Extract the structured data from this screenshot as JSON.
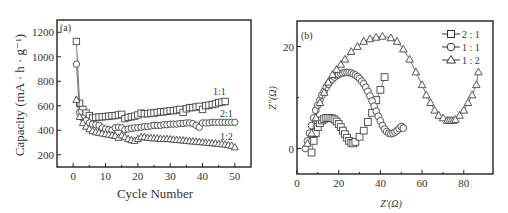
{
  "chart_data": [
    {
      "type": "line",
      "panel": "(a)",
      "xlabel": "Cycle Number",
      "ylabel": "Capacity (mA · h · g⁻¹)",
      "xlim": [
        -5,
        55
      ],
      "ylim": [
        100,
        1300
      ],
      "xticks": [
        0,
        10,
        20,
        30,
        40,
        50
      ],
      "yticks": [
        200,
        400,
        600,
        800,
        1000,
        1200
      ],
      "grid": false,
      "series": [
        {
          "name": "1:1",
          "marker": "square",
          "x": [
            1,
            2,
            3,
            4,
            5,
            6,
            7,
            8,
            9,
            10,
            11,
            12,
            13,
            14,
            15,
            16,
            17,
            18,
            19,
            20,
            21,
            22,
            23,
            24,
            25,
            26,
            27,
            28,
            29,
            30,
            31,
            32,
            33,
            34,
            35,
            36,
            37,
            38,
            39,
            40,
            41,
            42,
            43,
            44,
            45,
            46,
            47
          ],
          "values": [
            1125,
            620,
            570,
            540,
            520,
            500,
            505,
            508,
            510,
            512,
            515,
            518,
            520,
            525,
            530,
            495,
            505,
            510,
            515,
            525,
            540,
            535,
            535,
            540,
            540,
            545,
            550,
            550,
            555,
            560,
            560,
            565,
            570,
            545,
            575,
            585,
            585,
            590,
            595,
            570,
            600,
            605,
            610,
            615,
            625,
            630,
            635
          ]
        },
        {
          "name": "2:1",
          "marker": "circle",
          "x": [
            1,
            2,
            3,
            4,
            5,
            6,
            7,
            8,
            9,
            10,
            11,
            12,
            13,
            14,
            15,
            16,
            17,
            18,
            19,
            20,
            21,
            22,
            23,
            24,
            25,
            26,
            27,
            28,
            29,
            30,
            31,
            32,
            33,
            34,
            35,
            36,
            37,
            38,
            39,
            40,
            41,
            42,
            43,
            44,
            45,
            46,
            47,
            48,
            49,
            50
          ],
          "values": [
            940,
            545,
            500,
            480,
            460,
            450,
            445,
            440,
            420,
            410,
            405,
            400,
            420,
            425,
            420,
            405,
            410,
            415,
            420,
            420,
            425,
            430,
            430,
            435,
            440,
            440,
            440,
            445,
            445,
            450,
            450,
            450,
            455,
            455,
            460,
            460,
            455,
            440,
            425,
            460,
            460,
            460,
            465,
            465,
            465,
            465,
            465,
            465,
            465,
            465
          ]
        },
        {
          "name": "1:2",
          "marker": "triangle",
          "x": [
            1,
            2,
            3,
            4,
            5,
            6,
            7,
            8,
            9,
            10,
            11,
            12,
            13,
            14,
            15,
            16,
            17,
            18,
            19,
            20,
            21,
            22,
            23,
            24,
            25,
            26,
            27,
            28,
            29,
            30,
            31,
            32,
            33,
            34,
            35,
            36,
            37,
            38,
            39,
            40,
            41,
            42,
            43,
            44,
            45,
            46,
            47,
            48,
            49,
            50
          ],
          "values": [
            650,
            510,
            460,
            430,
            410,
            395,
            385,
            380,
            375,
            370,
            365,
            360,
            355,
            340,
            360,
            345,
            330,
            320,
            315,
            330,
            345,
            345,
            340,
            338,
            335,
            335,
            332,
            330,
            330,
            328,
            325,
            322,
            320,
            318,
            315,
            312,
            310,
            308,
            305,
            303,
            300,
            298,
            295,
            293,
            290,
            288,
            285,
            280,
            275,
            262
          ]
        }
      ],
      "annotations": [
        {
          "text": "1:1",
          "x": 45,
          "y": 700
        },
        {
          "text": "2:1",
          "x": 47,
          "y": 520
        },
        {
          "text": "1:2",
          "x": 47,
          "y": 330
        }
      ]
    },
    {
      "type": "scatter",
      "panel": "(b)",
      "xlabel": "Z'(Ω)",
      "ylabel": "Z''(Ω)",
      "xlim": [
        0,
        94
      ],
      "ylim": [
        -5,
        25
      ],
      "xticks": [
        0,
        20,
        40,
        60,
        80
      ],
      "yticks": [
        0,
        20
      ],
      "grid": false,
      "legend_position": "upper right",
      "series": [
        {
          "name": "2 : 1",
          "marker": "square",
          "x": [
            7,
            8,
            9,
            10,
            11,
            12,
            13,
            14,
            15,
            16,
            17,
            18,
            19,
            20,
            21,
            22,
            23,
            24,
            25,
            26,
            27,
            28,
            30,
            32,
            34,
            36,
            38,
            40,
            42
          ],
          "values": [
            -0.8,
            1.5,
            3,
            4.2,
            5,
            5.5,
            5.8,
            6,
            6,
            6,
            5.9,
            5.7,
            5.3,
            4.8,
            4.2,
            3.5,
            2.8,
            2.1,
            1.5,
            1.1,
            1,
            1.3,
            2.3,
            3.5,
            5.2,
            7,
            9.5,
            11.5,
            14
          ]
        },
        {
          "name": "1 : 1",
          "marker": "circle",
          "x": [
            4,
            5,
            6,
            7,
            8,
            9,
            10,
            11,
            12,
            13,
            14,
            15,
            16,
            17,
            18,
            19,
            20,
            21,
            22,
            23,
            24,
            25,
            26,
            27,
            28,
            29,
            30,
            31,
            32,
            33,
            34,
            35,
            36,
            37,
            38,
            39,
            40,
            41,
            42,
            43,
            44,
            45,
            46,
            47,
            48,
            49,
            50,
            51
          ],
          "values": [
            0,
            1.5,
            3,
            4.5,
            6,
            7.5,
            8.5,
            9.5,
            10.5,
            11.2,
            12,
            12.6,
            13.2,
            13.6,
            14,
            14.3,
            14.5,
            14.7,
            14.8,
            14.9,
            14.9,
            14.9,
            14.8,
            14.6,
            14.4,
            14.1,
            13.7,
            13.2,
            12.7,
            12,
            11.2,
            10.3,
            9.3,
            8.3,
            7.3,
            6.3,
            5.4,
            4.5,
            3.8,
            3.3,
            3,
            2.9,
            3,
            3.2,
            3.5,
            3.9,
            4.3,
            4
          ]
        },
        {
          "name": "1 : 2",
          "marker": "triangle",
          "x": [
            5,
            7,
            9,
            11,
            13,
            15,
            17,
            19,
            21,
            23,
            26,
            29,
            32,
            35,
            38,
            41,
            45,
            48,
            51,
            54,
            57,
            60,
            62,
            64,
            66,
            68,
            70,
            72,
            73,
            74,
            75,
            76,
            78,
            80,
            82,
            84,
            86,
            87
          ],
          "values": [
            1,
            3,
            6,
            9,
            11,
            13,
            14.5,
            15.5,
            16.5,
            17.5,
            19,
            20,
            21,
            21.5,
            21.8,
            22,
            21.7,
            21,
            19.5,
            17.5,
            15,
            12.5,
            10.5,
            9,
            7.5,
            6.5,
            6,
            5.5,
            5.5,
            5.5,
            5.5,
            5.7,
            6.5,
            7.5,
            9,
            10.5,
            12.5,
            15
          ]
        }
      ]
    }
  ],
  "panel_a": {
    "label": "(a)",
    "xlabel": "Cycle Number",
    "ylabel": "Capacity (mA · h · g⁻¹)",
    "annotations": [
      "1:1",
      "2:1",
      "1:2"
    ]
  },
  "panel_b": {
    "label": "(b)",
    "xlabel": "Z'(Ω)",
    "ylabel": "Z''(Ω)",
    "legend": [
      "2 : 1",
      "1 : 1",
      "1 : 2"
    ]
  }
}
